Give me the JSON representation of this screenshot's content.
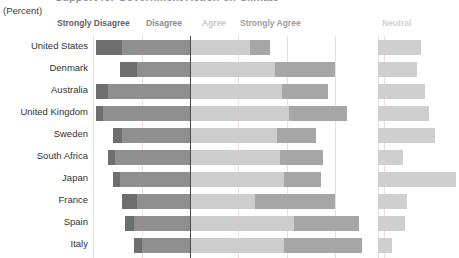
{
  "header": {
    "title_remnant": "Support for Government Action on Climate",
    "subtitle": "(Percent)"
  },
  "legend": {
    "strongly_disagree": "Strongly Disagree",
    "disagree": "Disagree",
    "agree": "Agree",
    "strongly_agree": "Strongly Agree",
    "neutral": "Neutral"
  },
  "colors": {
    "strongly_disagree": "#6e6e6e",
    "disagree": "#8f8f8f",
    "agree": "#cdcdcd",
    "strongly_agree": "#a6a6a6",
    "neutral": "#cfcfcf",
    "zero_axis": "#4a4a4a",
    "gridline": "#f0dcd6"
  },
  "chart_data": {
    "type": "bar",
    "title": "Support for Government Action on Climate",
    "subtitle": "(Percent)",
    "xlabel": "",
    "ylabel": "",
    "orientation": "horizontal",
    "stacked": "diverging",
    "grid": true,
    "legend_position": "top",
    "zero_at": 0,
    "xlim": [
      -40,
      80
    ],
    "categories": [
      "United States",
      "Denmark",
      "Australia",
      "United Kingdom",
      "Sweden",
      "South Africa",
      "Japan",
      "France",
      "Spain",
      "Italy"
    ],
    "series": [
      {
        "name": "Strongly Disagree",
        "values": [
          11,
          7,
          5,
          3,
          4,
          3,
          3,
          6,
          4,
          3
        ]
      },
      {
        "name": "Disagree",
        "values": [
          28,
          22,
          34,
          36,
          28,
          31,
          29,
          22,
          23,
          20
        ]
      },
      {
        "name": "Agree",
        "values": [
          25,
          35,
          38,
          41,
          36,
          37,
          39,
          27,
          43,
          39
        ]
      },
      {
        "name": "Strongly Agree",
        "values": [
          8,
          25,
          19,
          24,
          16,
          18,
          15,
          33,
          27,
          32
        ]
      }
    ],
    "neutral": {
      "name": "Neutral",
      "values": [
        21,
        19,
        23,
        25,
        28,
        12,
        38,
        14,
        13,
        7
      ]
    }
  }
}
